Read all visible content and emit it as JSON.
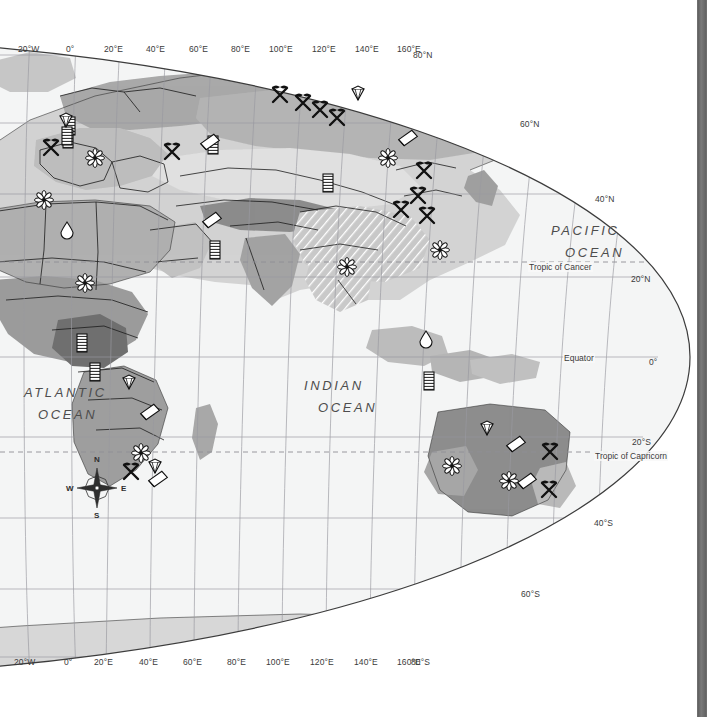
{
  "map": {
    "title": "World resources map (Eastern Hemisphere)",
    "projection": "oval / elliptical world projection",
    "colors": {
      "ocean": "#f4f5f5",
      "land_light": "#dcdcdc",
      "land_mid": "#b4b4b4",
      "land_dark": "#8f8f8f",
      "land_darkest": "#6f6f6f",
      "border": "#1a1a1a",
      "graticule": "#9a9aa0",
      "outline": "#3c3c3c",
      "scrollbar": "#6e6e6e"
    },
    "longitude_labels_top": [
      {
        "text": "20°W",
        "x": 18
      },
      {
        "text": "0°",
        "x": 66
      },
      {
        "text": "20°E",
        "x": 104
      },
      {
        "text": "40°E",
        "x": 146
      },
      {
        "text": "60°E",
        "x": 189
      },
      {
        "text": "80°E",
        "x": 231
      },
      {
        "text": "100°E",
        "x": 269
      },
      {
        "text": "120°E",
        "x": 312
      },
      {
        "text": "140°E",
        "x": 355
      },
      {
        "text": "160°E",
        "x": 397
      }
    ],
    "longitude_labels_bottom": [
      {
        "text": "20°W",
        "x": 14
      },
      {
        "text": "0°",
        "x": 64
      },
      {
        "text": "20°E",
        "x": 94
      },
      {
        "text": "40°E",
        "x": 139
      },
      {
        "text": "60°E",
        "x": 183
      },
      {
        "text": "80°E",
        "x": 227
      },
      {
        "text": "100°E",
        "x": 266
      },
      {
        "text": "120°E",
        "x": 310
      },
      {
        "text": "140°E",
        "x": 354
      },
      {
        "text": "160°E",
        "x": 397
      }
    ],
    "latitude_labels": [
      {
        "text": "80°N",
        "x": 413,
        "y": 50
      },
      {
        "text": "60°N",
        "x": 520,
        "y": 119
      },
      {
        "text": "40°N",
        "x": 595,
        "y": 194
      },
      {
        "text": "20°N",
        "x": 631,
        "y": 274
      },
      {
        "text": "0°",
        "x": 649,
        "y": 357
      },
      {
        "text": "20°S",
        "x": 632,
        "y": 437
      },
      {
        "text": "40°S",
        "x": 594,
        "y": 518
      },
      {
        "text": "60°S",
        "x": 521,
        "y": 589
      },
      {
        "text": "80°S",
        "x": 411,
        "y": 657
      }
    ],
    "special_lines": [
      {
        "name": "Tropic of Cancer",
        "label": "Tropic of Cancer",
        "x": 528,
        "y": 262,
        "style": "dashed"
      },
      {
        "name": "Equator",
        "label": "Equator",
        "x": 563,
        "y": 353,
        "style": "solid"
      },
      {
        "name": "Tropic of Capricorn",
        "label": "Tropic of Capricorn",
        "x": 594,
        "y": 451,
        "style": "dashed"
      }
    ],
    "ocean_labels": [
      {
        "lines": [
          "ATLANTIC",
          "OCEAN"
        ],
        "x": 24,
        "y": 385
      },
      {
        "lines": [
          "INDIAN",
          "OCEAN"
        ],
        "x": 304,
        "y": 378
      },
      {
        "lines": [
          "PACIFIC",
          "OCEAN"
        ],
        "x": 551,
        "y": 223
      }
    ],
    "compass": {
      "north": "N",
      "west": "W",
      "east": "E",
      "south": "S"
    },
    "resource_symbols": [
      {
        "type": "oil-barrel-icon",
        "x": 70,
        "y": 126
      },
      {
        "type": "oil-barrel-icon",
        "x": 68,
        "y": 139
      },
      {
        "type": "oil-barrel-icon",
        "x": 67,
        "y": 136
      },
      {
        "type": "pickaxe-icon",
        "x": 51,
        "y": 148
      },
      {
        "type": "gem-icon",
        "x": 66,
        "y": 120
      },
      {
        "type": "flower-icon",
        "x": 95,
        "y": 158
      },
      {
        "type": "flower-icon",
        "x": 44,
        "y": 200
      },
      {
        "type": "oil-barrel-icon",
        "x": 213,
        "y": 145
      },
      {
        "type": "pickaxe-icon",
        "x": 172,
        "y": 152
      },
      {
        "type": "ingot-icon",
        "x": 210,
        "y": 142
      },
      {
        "type": "pickaxe-icon",
        "x": 280,
        "y": 95
      },
      {
        "type": "pickaxe-icon",
        "x": 303,
        "y": 103
      },
      {
        "type": "pickaxe-icon",
        "x": 320,
        "y": 110
      },
      {
        "type": "pickaxe-icon",
        "x": 337,
        "y": 118
      },
      {
        "type": "gem-icon",
        "x": 358,
        "y": 93
      },
      {
        "type": "ingot-icon",
        "x": 408,
        "y": 138
      },
      {
        "type": "flower-icon",
        "x": 388,
        "y": 158
      },
      {
        "type": "pickaxe-icon",
        "x": 424,
        "y": 171
      },
      {
        "type": "pickaxe-icon",
        "x": 418,
        "y": 196
      },
      {
        "type": "oil-barrel-icon",
        "x": 328,
        "y": 183
      },
      {
        "type": "pickaxe-icon",
        "x": 401,
        "y": 210
      },
      {
        "type": "pickaxe-icon",
        "x": 427,
        "y": 216
      },
      {
        "type": "flower-icon",
        "x": 440,
        "y": 250
      },
      {
        "type": "ingot-icon",
        "x": 212,
        "y": 220
      },
      {
        "type": "oil-barrel-icon",
        "x": 215,
        "y": 250
      },
      {
        "type": "flower-icon",
        "x": 347,
        "y": 267
      },
      {
        "type": "droplet-icon",
        "x": 67,
        "y": 230
      },
      {
        "type": "flower-icon",
        "x": 85,
        "y": 283
      },
      {
        "type": "oil-barrel-icon",
        "x": 82,
        "y": 343
      },
      {
        "type": "oil-barrel-icon",
        "x": 95,
        "y": 372
      },
      {
        "type": "gem-icon",
        "x": 129,
        "y": 382
      },
      {
        "type": "ingot-icon",
        "x": 150,
        "y": 412
      },
      {
        "type": "droplet-icon",
        "x": 426,
        "y": 339
      },
      {
        "type": "oil-barrel-icon",
        "x": 429,
        "y": 381
      },
      {
        "type": "gem-icon",
        "x": 487,
        "y": 428
      },
      {
        "type": "ingot-icon",
        "x": 516,
        "y": 444
      },
      {
        "type": "pickaxe-icon",
        "x": 550,
        "y": 452
      },
      {
        "type": "flower-icon",
        "x": 452,
        "y": 466
      },
      {
        "type": "flower-icon",
        "x": 509,
        "y": 481
      },
      {
        "type": "ingot-icon",
        "x": 527,
        "y": 481
      },
      {
        "type": "pickaxe-icon",
        "x": 549,
        "y": 490
      },
      {
        "type": "flower-icon",
        "x": 141,
        "y": 453
      },
      {
        "type": "gem-icon",
        "x": 155,
        "y": 466
      },
      {
        "type": "ingot-icon",
        "x": 158,
        "y": 479
      },
      {
        "type": "pickaxe-icon",
        "x": 131,
        "y": 472
      }
    ]
  }
}
